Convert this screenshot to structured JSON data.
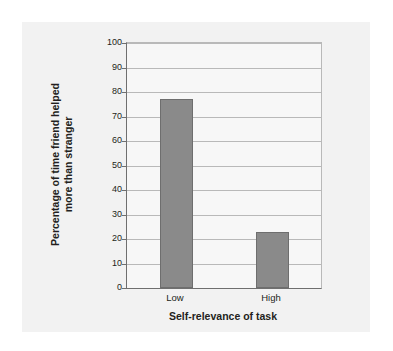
{
  "chart_data": {
    "type": "bar",
    "title": "",
    "categories": [
      "Low",
      "High"
    ],
    "values": [
      77,
      23
    ],
    "xlabel": "Self-relevance of task",
    "ylabel": "Percentage of time friend helped more than stranger",
    "ylabel_lines": [
      "Percentage of time friend helped",
      "more than stranger"
    ],
    "ylim": [
      0,
      100
    ],
    "ytick_step": 10,
    "yticks": [
      100,
      90,
      80,
      70,
      60,
      50,
      40,
      30,
      20,
      10,
      0
    ],
    "ytick_labels": [
      "100",
      "90",
      "80",
      "70",
      "60",
      "50",
      "40",
      "30",
      "20",
      "10",
      "0"
    ],
    "grid": true,
    "legend": false,
    "bar_color": "#8a8a8a",
    "bar_edge_color": "#6e6e6e",
    "plot_background": "#f7f7f7",
    "figure_background": "#f2f2f2",
    "page_background": "#ffffff",
    "axis_color": "#6f6f6f",
    "gridline_color": "#b9b9b9",
    "text_color": "#231f20"
  }
}
